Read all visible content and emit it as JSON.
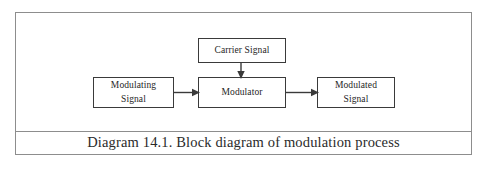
{
  "figure": {
    "caption": "Diagram 14.1. Block diagram of modulation process",
    "border_color": "#8d8d8d",
    "background_color": "#ffffff"
  },
  "diagram": {
    "type": "block-diagram",
    "line_color": "#3a3a3a",
    "nodes": [
      {
        "id": "carrier",
        "label": "Carrier Signal",
        "lines": [
          "Carrier Signal"
        ]
      },
      {
        "id": "modulating",
        "label": "Modulating Signal",
        "lines": [
          "Modulating",
          "Signal"
        ]
      },
      {
        "id": "modulator",
        "label": "Modulator",
        "lines": [
          "Modulator"
        ]
      },
      {
        "id": "modulated",
        "label": "Modulated Signal",
        "lines": [
          "Modulated",
          "Signal"
        ]
      }
    ],
    "connections": [
      {
        "id": "modulating-to-modulator",
        "from": "modulating",
        "to": "modulator",
        "direction": "right"
      },
      {
        "id": "carrier-to-modulator",
        "from": "carrier",
        "to": "modulator",
        "direction": "down"
      },
      {
        "id": "modulator-to-modulated",
        "from": "modulator",
        "to": "modulated",
        "direction": "right"
      }
    ]
  }
}
